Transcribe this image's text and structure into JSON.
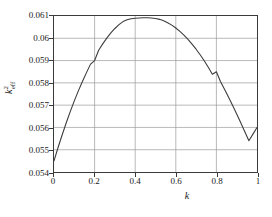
{
  "chart_data": {
    "type": "line",
    "title": "",
    "xlabel": "k",
    "ylabel": "k²eff",
    "ylabel_base": "k",
    "ylabel_sup": "2",
    "ylabel_sub": "eff",
    "xlim": [
      0,
      1
    ],
    "ylim": [
      0.054,
      0.061
    ],
    "grid": true,
    "legend": "none",
    "xticks": [
      0,
      0.2,
      0.4,
      0.6,
      0.8,
      1
    ],
    "xtick_labels": [
      "0",
      "0.2",
      "0.4",
      "0.6",
      "0.8",
      "1"
    ],
    "yticks": [
      0.054,
      0.055,
      0.056,
      0.057,
      0.058,
      0.059,
      0.06,
      0.061
    ],
    "ytick_labels": [
      "0.054",
      "0.055",
      "0.056",
      "0.057",
      "0.058",
      "0.059",
      "0.06",
      "0.061"
    ],
    "series": [
      {
        "name": "k_eff squared",
        "color": "#3c3c3c",
        "line_width": 1.1,
        "x": [
          0.0,
          0.02,
          0.04,
          0.06,
          0.08,
          0.1,
          0.12,
          0.14,
          0.16,
          0.18,
          0.2,
          0.22,
          0.24,
          0.26,
          0.28,
          0.3,
          0.32,
          0.34,
          0.36,
          0.38,
          0.4,
          0.42,
          0.44,
          0.46,
          0.48,
          0.5,
          0.52,
          0.54,
          0.56,
          0.58,
          0.6,
          0.62,
          0.64,
          0.66,
          0.68,
          0.7,
          0.72,
          0.74,
          0.76,
          0.78,
          0.8,
          0.82,
          0.84,
          0.86,
          0.88,
          0.9,
          0.92,
          0.94,
          0.96,
          0.98,
          1.0
        ],
        "y": [
          0.0545,
          0.0551,
          0.05566,
          0.0562,
          0.05671,
          0.05719,
          0.05764,
          0.05806,
          0.05846,
          0.05884,
          0.059,
          0.05946,
          0.05975,
          0.06001,
          0.06024,
          0.06044,
          0.06061,
          0.06075,
          0.06083,
          0.06088,
          0.0609,
          0.06091,
          0.06092,
          0.06092,
          0.06091,
          0.06089,
          0.06085,
          0.06079,
          0.0607,
          0.06059,
          0.06046,
          0.06031,
          0.06014,
          0.05995,
          0.05974,
          0.05951,
          0.05926,
          0.05899,
          0.0587,
          0.05839,
          0.0585,
          0.05806,
          0.05771,
          0.05735,
          0.05698,
          0.0566,
          0.05621,
          0.05581,
          0.0554,
          0.0557,
          0.056
        ]
      }
    ],
    "annotations": {
      "peak_x": 0.47,
      "peak_y": 0.0609,
      "start_y": 0.0545,
      "end_y": 0.056
    }
  },
  "colors": {
    "curve": "#3c3c3c",
    "grid": "#9a9a9a",
    "frame": "#3a3a3a",
    "text": "#1a1a1a",
    "background": "#ffffff"
  }
}
